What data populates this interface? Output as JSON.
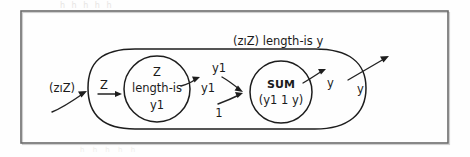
{
  "figure": {
    "title_caption": "",
    "outer_label": "(zıZ) length-is y",
    "input_label": "(zıZ)",
    "stadium_inner_input_label": "Z",
    "left_node": {
      "line1": "Z",
      "line2": "length-is",
      "line3": "y1"
    },
    "left_node_output_label": "y1",
    "sum_node": {
      "line1": "SUM",
      "line2": "(y1 1 y)"
    },
    "sum_input_top_label": "y1",
    "sum_input_bottom_label": "1",
    "sum_output_label": "y",
    "outer_output_label": "y"
  },
  "ghost": {
    "top_bleed": "h    h     h     h      h",
    "bottom_bleed": "h   h    h   h    h"
  },
  "colors": {
    "ink": "#1d1d1d",
    "frame": "#6b6b6b",
    "paper": "#fefefe",
    "ghost": "#e7e5e3"
  }
}
